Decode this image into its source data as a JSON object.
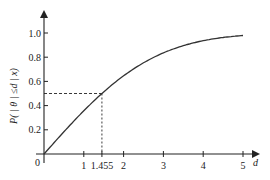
{
  "chart_data": {
    "type": "line",
    "title": "",
    "xlabel": "d",
    "ylabel": "P( | θ | ≤d | x)",
    "xlim": [
      0,
      5.4
    ],
    "ylim": [
      0,
      1.1
    ],
    "x_ticks": [
      "1",
      "1.455",
      "2",
      "3",
      "4",
      "5"
    ],
    "x_tick_values": [
      1,
      1.455,
      2,
      3,
      4,
      5
    ],
    "y_ticks": [
      "0.2",
      "0.4",
      "0.6",
      "0.8",
      "1.0"
    ],
    "y_tick_values": [
      0.2,
      0.4,
      0.6,
      0.8,
      1.0
    ],
    "origin_label": "0",
    "grid": false,
    "series": [
      {
        "name": "P(|θ| ≤ d | x)",
        "x": [
          0,
          0.5,
          1,
          1.455,
          2,
          2.5,
          3,
          3.5,
          4,
          4.5,
          5
        ],
        "values": [
          0,
          0.18,
          0.35,
          0.5,
          0.65,
          0.75,
          0.83,
          0.89,
          0.93,
          0.96,
          0.98
        ]
      }
    ],
    "annotations": [
      {
        "type": "dashed-guide",
        "x": 1.455,
        "y": 0.5,
        "label": "1.455"
      }
    ]
  }
}
